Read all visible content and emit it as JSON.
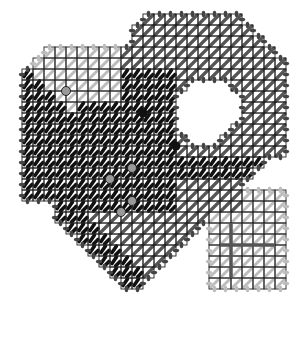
{
  "diagram": {
    "title": "",
    "type": "needlepoint-stitch-chart",
    "cell_size": 11,
    "origin": {
      "x": 22,
      "y": 14
    },
    "cols": 24,
    "rows": 27,
    "colors": {
      "grid": "#222222",
      "dark_stitch": "#111111",
      "mid_stitch": "#555555",
      "light_stitch": "#bdbdbd",
      "edge_stitch": "#444444",
      "bead_fill": "#9a9a9a",
      "bead_dark": "#111111",
      "background": "#ffffff"
    },
    "regions": {
      "light_diagonal": "left lobe upper area, light gray diagonal stitches",
      "dark_tent": "central/left dark tent stitch area",
      "mid_diagonal": "right lobe and lower band, dark gray diagonal stitches",
      "light_square": "lower-right square with light stitches and cross bar"
    },
    "beads": [
      {
        "col": 4,
        "row": 7,
        "style": "light"
      },
      {
        "col": 11,
        "row": 9,
        "style": "dark"
      },
      {
        "col": 14,
        "row": 12,
        "style": "dark"
      },
      {
        "col": 10,
        "row": 14,
        "style": "light"
      },
      {
        "col": 8,
        "row": 15,
        "style": "light"
      },
      {
        "col": 10,
        "row": 17,
        "style": "light"
      },
      {
        "col": 9,
        "row": 18,
        "style": "light"
      }
    ],
    "cross_bar": {
      "h": {
        "col0": 18,
        "col1": 23,
        "row": 21
      },
      "v": {
        "col": 19,
        "row0": 19,
        "row1": 24
      }
    }
  }
}
